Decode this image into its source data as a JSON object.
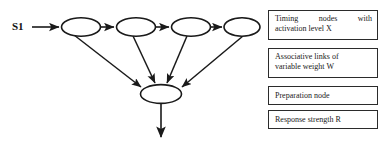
{
  "figure": {
    "type": "neural-network-schematic",
    "background_color": "#ffffff",
    "stroke_color": "#1a1a1a"
  },
  "diagram": {
    "input_label": "S1",
    "timing_nodes": [
      {
        "id": "t1",
        "cx": 81,
        "cy": 27,
        "rx": 19,
        "ry": 9
      },
      {
        "id": "t2",
        "cx": 136,
        "cy": 27,
        "rx": 19,
        "ry": 9
      },
      {
        "id": "t3",
        "cx": 191,
        "cy": 27,
        "rx": 19,
        "ry": 9
      },
      {
        "id": "t4",
        "cx": 242,
        "cy": 27,
        "rx": 18,
        "ry": 9
      }
    ],
    "preparation_node": {
      "id": "p1",
      "cx": 161,
      "cy": 94,
      "rx": 20,
      "ry": 9
    },
    "input_arrow": {
      "x1": 32,
      "y1": 27,
      "x2": 60,
      "y2": 27
    },
    "chain_arrows": [
      {
        "from": "t1",
        "to": "t2",
        "x1": 100,
        "y1": 27,
        "x2": 115,
        "y2": 27
      },
      {
        "from": "t2",
        "to": "t3",
        "x1": 155,
        "y1": 27,
        "x2": 170,
        "y2": 27
      },
      {
        "from": "t3",
        "to": "t4",
        "x1": 210,
        "y1": 27,
        "x2": 223,
        "y2": 27
      }
    ],
    "associative_links": [
      {
        "from": "t1",
        "to": "p1",
        "x1": 76,
        "y1": 36,
        "x2": 142,
        "y2": 88
      },
      {
        "from": "t2",
        "to": "p1",
        "x1": 133,
        "y1": 36,
        "x2": 155,
        "y2": 84
      },
      {
        "from": "t3",
        "to": "p1",
        "x1": 186,
        "y1": 36,
        "x2": 167,
        "y2": 84
      },
      {
        "from": "t4",
        "to": "p1",
        "x1": 240,
        "y1": 36,
        "x2": 181,
        "y2": 88
      }
    ],
    "output_arrow": {
      "x1": 161,
      "y1": 103,
      "x2": 161,
      "y2": 139,
      "semantic": "response-strength-output"
    }
  },
  "legend": {
    "items": [
      {
        "id": "timing-nodes",
        "line_1": "Timing nodes with",
        "line_2": "activation level X",
        "lines": 2,
        "justified": true
      },
      {
        "id": "associative-links",
        "line_1": "Associative links of",
        "line_2": "variable weight W",
        "lines": 2,
        "justified": false
      },
      {
        "id": "preparation-node",
        "line_1": "Preparation node",
        "line_2": "",
        "lines": 1,
        "justified": false
      },
      {
        "id": "response-strength",
        "line_1": "Response strength R",
        "line_2": "",
        "lines": 1,
        "justified": false
      }
    ]
  }
}
